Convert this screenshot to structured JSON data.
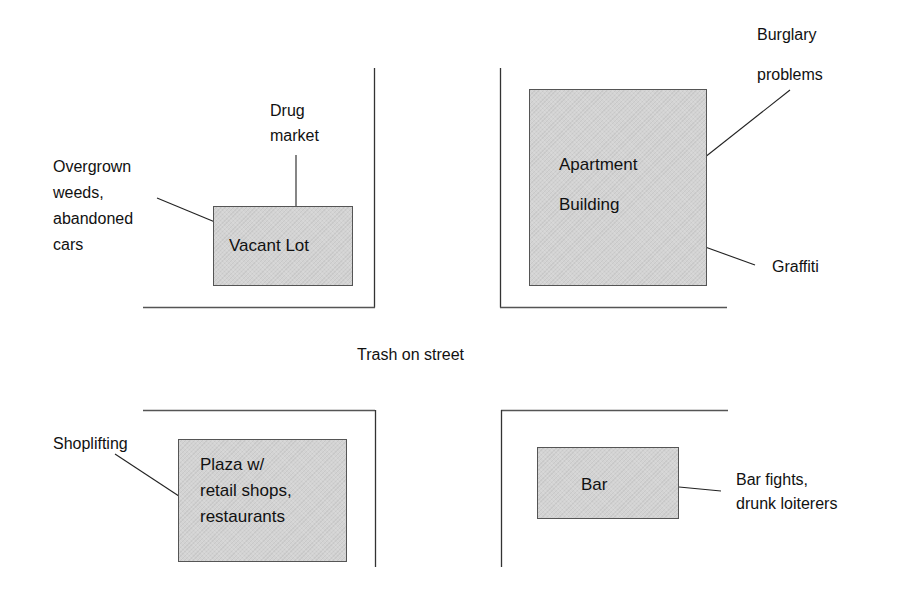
{
  "diagram": {
    "street_label": "Trash on street",
    "blocks": [
      {
        "id": "vacant-lot",
        "label_lines": [
          "Vacant Lot"
        ],
        "problems": [
          {
            "lines": [
              "Drug",
              "market"
            ]
          },
          {
            "lines": [
              "Overgrown",
              "weeds,",
              "abandoned",
              "cars"
            ]
          }
        ]
      },
      {
        "id": "apartment-building",
        "label_lines": [
          "Apartment",
          "Building"
        ],
        "problems": [
          {
            "lines": [
              "Burglary",
              "problems"
            ]
          },
          {
            "lines": [
              "Graffiti"
            ]
          }
        ]
      },
      {
        "id": "plaza",
        "label_lines": [
          "Plaza w/",
          "retail shops,",
          "restaurants"
        ],
        "problems": [
          {
            "lines": [
              "Shoplifting"
            ]
          }
        ]
      },
      {
        "id": "bar",
        "label_lines": [
          "Bar"
        ],
        "problems": [
          {
            "lines": [
              "Bar fights,",
              "drunk loiterers"
            ]
          }
        ]
      }
    ],
    "colors": {
      "building_fill": "#d3d3d3",
      "line": "#333333",
      "text": "#111111"
    }
  }
}
